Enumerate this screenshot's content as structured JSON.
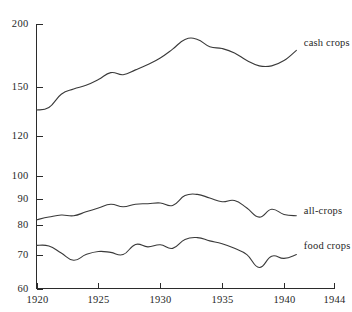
{
  "chart_data": {
    "type": "line",
    "title": "",
    "subtitle": "",
    "xlabel": "",
    "ylabel": "",
    "yscale": "log",
    "grid": false,
    "legend_position": "right-inline",
    "x": [
      1920,
      1921,
      1922,
      1923,
      1924,
      1925,
      1926,
      1927,
      1928,
      1929,
      1930,
      1931,
      1932,
      1933,
      1934,
      1935,
      1936,
      1937,
      1938,
      1939,
      1940,
      1941
    ],
    "xlim": [
      1920,
      1944
    ],
    "ylim": [
      60,
      200
    ],
    "xticks": [
      1920,
      1925,
      1930,
      1935,
      1940,
      1944
    ],
    "xtick_labels": [
      "1920",
      "1925",
      "1930",
      "1935",
      "1940",
      "1944"
    ],
    "yticks": [
      60,
      70,
      80,
      90,
      100,
      120,
      150,
      200
    ],
    "ytick_labels": [
      "60",
      "70",
      "80",
      "90",
      "100",
      "120",
      "150",
      "200"
    ],
    "series": [
      {
        "name": "cash crops",
        "label": "cash crops",
        "label_x": 1941.6,
        "label_y": 182,
        "values": [
          135,
          136.5,
          145,
          148.5,
          151,
          155,
          160,
          158.5,
          162,
          166,
          171,
          178,
          186,
          186,
          180,
          178.5,
          175,
          169,
          165,
          165,
          169,
          177
        ]
      },
      {
        "name": "all-crops",
        "label": "all-crops",
        "label_x": 1941.6,
        "label_y": 85,
        "values": [
          82,
          83,
          83.8,
          83.5,
          85,
          86.5,
          88,
          87,
          88,
          88.2,
          88.5,
          87.5,
          91.5,
          92,
          90.5,
          89,
          89.5,
          86.5,
          83,
          86,
          84,
          83.5
        ]
      },
      {
        "name": "food crops",
        "label": "food crops",
        "label_x": 1941.6,
        "label_y": 72.5,
        "values": [
          73,
          72.8,
          70.5,
          68.2,
          70,
          71,
          70.7,
          70,
          73.3,
          72.5,
          73.2,
          72,
          75,
          75.6,
          74.5,
          73.5,
          72,
          70,
          66,
          69.5,
          68.8,
          70
        ]
      }
    ]
  },
  "figure": {
    "background_color": "#ffffff",
    "line_color": "#3a3a3a",
    "axis_color": "#2b2b2b",
    "text_color": "#1f1f1f"
  }
}
